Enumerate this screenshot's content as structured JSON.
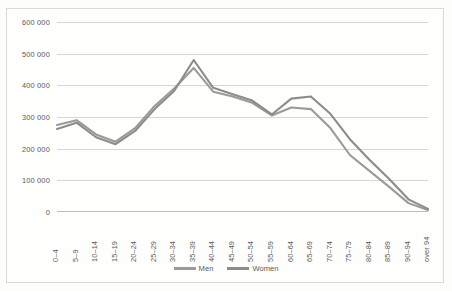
{
  "chart_data": {
    "type": "line",
    "title": "",
    "xlabel": "",
    "ylabel": "",
    "grid": true,
    "legend_position": "bottom",
    "ylim": [
      0,
      600000
    ],
    "yticks": [
      0,
      100000,
      200000,
      300000,
      400000,
      500000,
      600000
    ],
    "ytick_labels": [
      "0",
      "100 000",
      "200 000",
      "300 000",
      "400 000",
      "500 000",
      "600 000"
    ],
    "categories": [
      "0–4",
      "5–9",
      "10–14",
      "15–19",
      "20–24",
      "25–29",
      "30–34",
      "35–39",
      "40–44",
      "45–49",
      "50–54",
      "55–59",
      "60–64",
      "65–69",
      "70–74",
      "75–79",
      "80–84",
      "85–89",
      "90–94",
      "over 94"
    ],
    "series": [
      {
        "name": "Men",
        "color": "#9a9a97",
        "values": [
          275000,
          290000,
          245000,
          222000,
          265000,
          335000,
          390000,
          455000,
          380000,
          365000,
          345000,
          305000,
          330000,
          325000,
          265000,
          180000,
          130000,
          80000,
          28000,
          6000
        ]
      },
      {
        "name": "Women",
        "color": "#8c8c89",
        "values": [
          262000,
          282000,
          236000,
          214000,
          256000,
          325000,
          382000,
          480000,
          392000,
          372000,
          352000,
          308000,
          358000,
          365000,
          310000,
          230000,
          165000,
          105000,
          40000,
          10000
        ]
      }
    ]
  },
  "legend": {
    "items": [
      {
        "label": "Men",
        "color": "#9a9a97"
      },
      {
        "label": "Women",
        "color": "#8c8c89"
      }
    ]
  }
}
